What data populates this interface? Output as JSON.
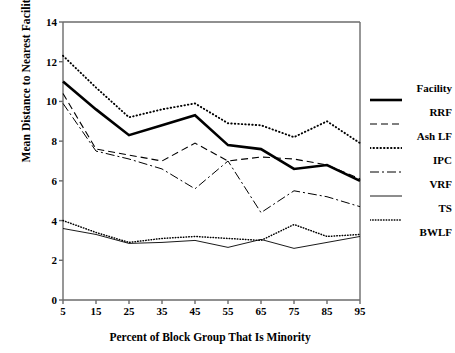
{
  "chart_data": {
    "type": "line",
    "title": "",
    "xlabel": "Percent of Block Group That Is Minority",
    "ylabel": "Mean Distance to Nearest Facility",
    "x": [
      5,
      15,
      25,
      35,
      45,
      55,
      65,
      75,
      85,
      95
    ],
    "categories": [
      "5",
      "15",
      "25",
      "35",
      "45",
      "55",
      "65",
      "75",
      "85",
      "95"
    ],
    "xtick_labels": [
      "5",
      "15",
      "25",
      "35",
      "45",
      "55",
      "65",
      "75",
      "85",
      "95"
    ],
    "ytick_labels": [
      "0",
      "2",
      "4",
      "6",
      "8",
      "10",
      "12",
      "14"
    ],
    "yticks": [
      0,
      2,
      4,
      6,
      8,
      10,
      12,
      14
    ],
    "xlim": [
      5,
      95
    ],
    "ylim": [
      0,
      14
    ],
    "grid": false,
    "legend_position": "right",
    "legend_title": "Facility",
    "series": [
      {
        "name": "RRF",
        "style": "solid-thick",
        "color": "#000000",
        "values": [
          11.0,
          9.6,
          8.3,
          8.8,
          9.3,
          7.8,
          7.6,
          6.6,
          6.8,
          6.0
        ]
      },
      {
        "name": "Ash LF",
        "style": "dashed",
        "color": "#000000",
        "values": [
          10.4,
          7.6,
          7.3,
          7.0,
          7.9,
          7.0,
          7.2,
          7.1,
          6.8,
          6.1
        ]
      },
      {
        "name": "IPC",
        "style": "dotted-coarse",
        "color": "#000000",
        "values": [
          12.3,
          10.7,
          9.2,
          9.6,
          9.9,
          8.9,
          8.8,
          8.2,
          9.0,
          7.9
        ]
      },
      {
        "name": "VRF",
        "style": "dash-dot",
        "color": "#000000",
        "values": [
          9.9,
          7.5,
          7.1,
          6.6,
          5.6,
          7.0,
          4.4,
          5.5,
          5.2,
          4.7
        ]
      },
      {
        "name": "TS",
        "style": "solid-thin",
        "color": "#000000",
        "values": [
          3.6,
          3.3,
          2.85,
          2.9,
          3.0,
          2.65,
          3.05,
          2.6,
          2.9,
          3.2
        ]
      },
      {
        "name": "BWLF",
        "style": "dotted-fine",
        "color": "#000000",
        "values": [
          4.0,
          3.4,
          2.9,
          3.1,
          3.2,
          3.1,
          3.0,
          3.8,
          3.2,
          3.3
        ]
      }
    ]
  },
  "legend": {
    "header": "Facility",
    "entries": [
      {
        "label": "RRF",
        "key_style": "solid-thick"
      },
      {
        "label": "Ash LF",
        "key_style": "dashed"
      },
      {
        "label": "IPC",
        "key_style": "dotted-coarse"
      },
      {
        "label": "VRF",
        "key_style": "dash-dot"
      },
      {
        "label": "TS",
        "key_style": "solid-thin"
      },
      {
        "label": "BWLF",
        "key_style": "dotted-fine"
      }
    ]
  },
  "axes": {
    "y_title": "Mean Distance to Nearest Facility",
    "x_title": "Percent of Block Group That Is Minority"
  },
  "colors": {
    "ink": "#000000",
    "axis": "#6b6b6b",
    "background": "#ffffff"
  }
}
